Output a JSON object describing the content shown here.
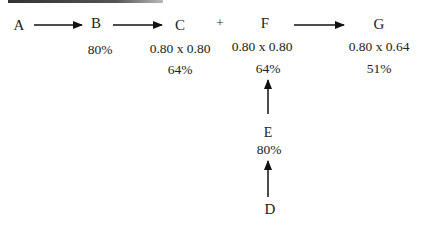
{
  "nodes": {
    "A": {
      "label": "A"
    },
    "B": {
      "label": "B",
      "calc": "",
      "percent": "80%"
    },
    "C": {
      "label": "C",
      "calc": "0.80 x 0.80",
      "percent": "64%"
    },
    "F": {
      "label": "F",
      "calc": "0.80 x 0.80",
      "percent": "64%"
    },
    "G": {
      "label": "G",
      "calc": "0.80 x 0.64",
      "percent": "51%"
    },
    "E": {
      "label": "E",
      "percent": "80%"
    },
    "D": {
      "label": "D"
    }
  },
  "operator": "+",
  "edges": [
    {
      "from": "A",
      "to": "B"
    },
    {
      "from": "B",
      "to": "C"
    },
    {
      "from": "F",
      "to": "G"
    },
    {
      "from": "E",
      "to": "F"
    },
    {
      "from": "D",
      "to": "E"
    }
  ]
}
